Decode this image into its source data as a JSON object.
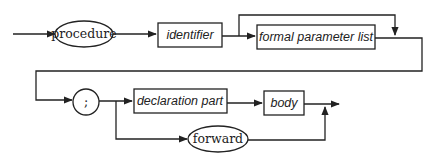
{
  "diagram": {
    "type": "syntax-diagram",
    "terminals": {
      "procedure": "procedure",
      "semicolon": ";",
      "forward": "forward"
    },
    "nonterminals": {
      "identifier": "identifier",
      "formal_parameter_list": "formal parameter list",
      "declaration_part": "declaration part",
      "body": "body"
    },
    "paths": [
      [
        "procedure",
        "identifier",
        "formal parameter list (optional)",
        ";",
        "declaration part",
        "body"
      ],
      [
        "procedure",
        "identifier",
        "formal parameter list (optional)",
        ";",
        "forward"
      ]
    ]
  }
}
